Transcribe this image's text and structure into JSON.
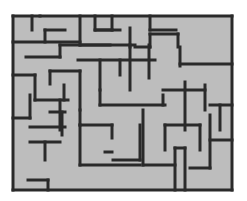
{
  "maze": {
    "background": "#ffffff",
    "floor_color": "#bdbdbd",
    "wall_color": "#2a2a2a",
    "wall_width": 3,
    "bounds": {
      "x": 13,
      "y": 16,
      "w": 219,
      "h": 174
    },
    "walls": [
      [
        13,
        16,
        232,
        16
      ],
      [
        13,
        190,
        232,
        190
      ],
      [
        13,
        16,
        13,
        190
      ],
      [
        232,
        16,
        232,
        190
      ],
      [
        32,
        16,
        32,
        30
      ],
      [
        45,
        30,
        45,
        42
      ],
      [
        45,
        30,
        65,
        30
      ],
      [
        13,
        42,
        80,
        42
      ],
      [
        80,
        16,
        80,
        45
      ],
      [
        26,
        57,
        60,
        57
      ],
      [
        60,
        45,
        60,
        57
      ],
      [
        60,
        45,
        110,
        45
      ],
      [
        95,
        16,
        95,
        30
      ],
      [
        95,
        30,
        112,
        30
      ],
      [
        112,
        16,
        112,
        30
      ],
      [
        96,
        30,
        120,
        30
      ],
      [
        150,
        16,
        150,
        30
      ],
      [
        150,
        30,
        176,
        30
      ],
      [
        40,
        16,
        40,
        16
      ],
      [
        130,
        28,
        130,
        47
      ],
      [
        135,
        47,
        150,
        47
      ],
      [
        150,
        34,
        150,
        47
      ],
      [
        150,
        34,
        178,
        34
      ],
      [
        178,
        34,
        178,
        47
      ],
      [
        80,
        45,
        135,
        45
      ],
      [
        78,
        60,
        155,
        60
      ],
      [
        100,
        60,
        100,
        90
      ],
      [
        130,
        45,
        130,
        90
      ],
      [
        120,
        60,
        120,
        75
      ],
      [
        149,
        45,
        149,
        78
      ],
      [
        180,
        47,
        180,
        66
      ],
      [
        180,
        64,
        232,
        64
      ],
      [
        13,
        75,
        35,
        75
      ],
      [
        35,
        75,
        35,
        100
      ],
      [
        50,
        71,
        80,
        71
      ],
      [
        50,
        71,
        50,
        84
      ],
      [
        80,
        71,
        80,
        110
      ],
      [
        35,
        100,
        68,
        100
      ],
      [
        64,
        85,
        64,
        100
      ],
      [
        100,
        90,
        100,
        105
      ],
      [
        100,
        105,
        165,
        105
      ],
      [
        163,
        105,
        163,
        95
      ],
      [
        163,
        90,
        205,
        90
      ],
      [
        205,
        85,
        205,
        110
      ],
      [
        185,
        82,
        185,
        130
      ],
      [
        60,
        130,
        60,
        100
      ],
      [
        50,
        112,
        65,
        112
      ],
      [
        62,
        112,
        62,
        135
      ],
      [
        30,
        127,
        65,
        127
      ],
      [
        30,
        142,
        60,
        142
      ],
      [
        45,
        142,
        45,
        160
      ],
      [
        13,
        118,
        30,
        118
      ],
      [
        30,
        118,
        30,
        95
      ],
      [
        80,
        110,
        80,
        125
      ],
      [
        80,
        125,
        112,
        125
      ],
      [
        113,
        160,
        140,
        160
      ],
      [
        140,
        125,
        140,
        160
      ],
      [
        112,
        125,
        112,
        138
      ],
      [
        105,
        152,
        112,
        152
      ],
      [
        165,
        125,
        165,
        150
      ],
      [
        165,
        125,
        200,
        125
      ],
      [
        200,
        125,
        200,
        150
      ],
      [
        175,
        148,
        175,
        190
      ],
      [
        185,
        148,
        185,
        190
      ],
      [
        175,
        148,
        185,
        148
      ],
      [
        210,
        105,
        232,
        105
      ],
      [
        220,
        105,
        220,
        130
      ],
      [
        210,
        140,
        232,
        140
      ],
      [
        190,
        168,
        210,
        168
      ],
      [
        210,
        115,
        210,
        168
      ],
      [
        80,
        165,
        140,
        165
      ],
      [
        80,
        125,
        80,
        165
      ],
      [
        143,
        165,
        175,
        165
      ],
      [
        143,
        110,
        143,
        165
      ],
      [
        28,
        180,
        48,
        180
      ],
      [
        48,
        180,
        48,
        190
      ]
    ]
  }
}
